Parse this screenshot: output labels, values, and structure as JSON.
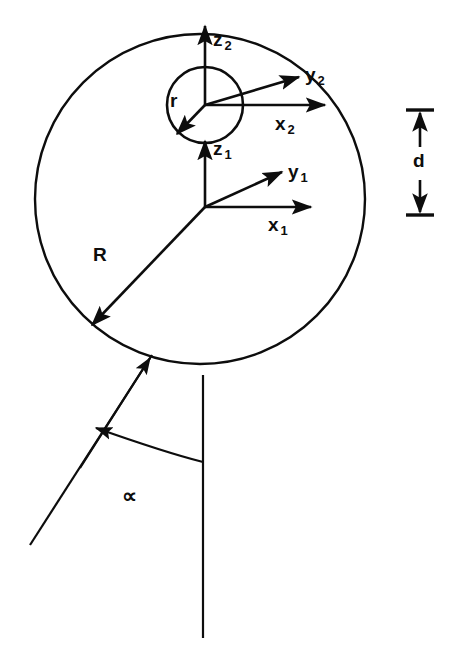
{
  "figure": {
    "type": "technical-line-diagram",
    "background_color": "#ffffff",
    "stroke_color": "#0d0d0d",
    "width": 450,
    "height": 657
  },
  "shapes": {
    "outer_circle": {
      "name": "outer-circle",
      "cx": 200,
      "cy": 199,
      "r": 165,
      "radius_label": "R"
    },
    "inner_circle": {
      "name": "inner-circle",
      "cx": 205,
      "cy": 105,
      "r": 38,
      "radius_label": "r"
    },
    "stem_line": {
      "name": "vertical-stem",
      "x": 203,
      "y1": 375,
      "y2": 638
    },
    "slanted_line": {
      "name": "slanted-line",
      "x1": 30,
      "y1": 545,
      "x2": 152,
      "y2": 355
    }
  },
  "labels": {
    "z2": {
      "base": "z",
      "sub": "2"
    },
    "y2": {
      "base": "y",
      "sub": "2"
    },
    "x2": {
      "base": "x",
      "sub": "2"
    },
    "z1": {
      "base": "z",
      "sub": "1"
    },
    "y1": {
      "base": "y",
      "sub": "1"
    },
    "x1": {
      "base": "x",
      "sub": "1"
    },
    "r": "r",
    "R": "R",
    "d": "d",
    "alpha": "∝"
  },
  "dimension_marker": {
    "name": "d-dimension",
    "label": "d",
    "x": 420,
    "top_y": 110,
    "bottom_y": 215,
    "tick_half_width": 14
  },
  "angle_marker": {
    "name": "alpha-angle",
    "label": "∝",
    "from": "vertical-stem",
    "to": "slanted-line",
    "arrowhead_at": "slanted-line"
  }
}
